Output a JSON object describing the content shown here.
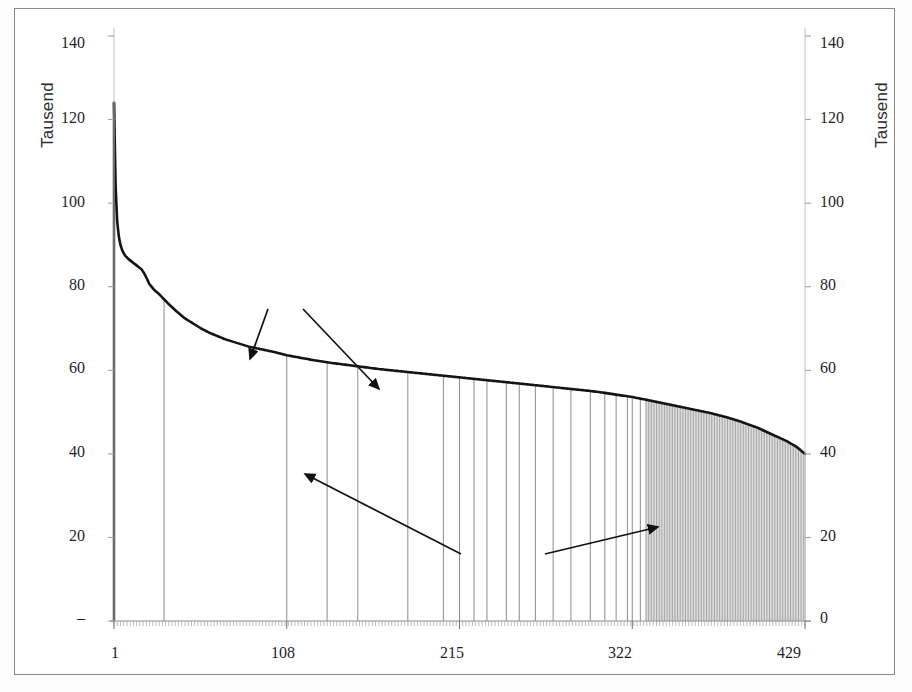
{
  "figure": {
    "background": "#ffffff",
    "frame_color": "#8a8a8a"
  },
  "chart_data": {
    "type": "bar",
    "title": "",
    "subtitle": "",
    "xlabel": "",
    "ylabel": "Tausend",
    "ylabel_right": "Tausend",
    "grid": false,
    "legend_position": "none",
    "xlim": [
      1,
      429
    ],
    "ylim": [
      0,
      140
    ],
    "yticks": [
      0,
      20,
      40,
      60,
      80,
      100,
      120,
      140
    ],
    "ytick_labels_left": [
      "–",
      "20",
      "40",
      "60",
      "80",
      "100",
      "120",
      "140"
    ],
    "ytick_labels_right": [
      "0",
      "20",
      "40",
      "60",
      "80",
      "100",
      "120",
      "140"
    ],
    "xticks": [
      1,
      108,
      215,
      322,
      429
    ],
    "xtick_labels": [
      "1",
      "108",
      "215",
      "322",
      "429"
    ],
    "series": [
      {
        "name": "Alle Kreise (sortiert, absteigend)",
        "kind": "bar-envelope",
        "x": [
          1,
          2,
          3,
          4,
          5,
          6,
          7,
          8,
          9,
          10,
          12,
          14,
          16,
          18,
          20,
          23,
          26,
          29,
          32,
          35,
          40,
          45,
          50,
          55,
          60,
          65,
          70,
          75,
          80,
          85,
          90,
          95,
          100,
          108,
          115,
          125,
          135,
          145,
          155,
          165,
          175,
          185,
          195,
          205,
          215,
          225,
          235,
          245,
          255,
          265,
          275,
          285,
          295,
          305,
          315,
          322,
          330,
          340,
          350,
          360,
          370,
          380,
          390,
          400,
          410,
          418,
          424,
          429
        ],
        "values": [
          124.0,
          104.0,
          95.5,
          92.0,
          90.0,
          88.8,
          88.0,
          87.4,
          87.0,
          86.6,
          86.0,
          85.4,
          84.8,
          84.2,
          83.0,
          80.6,
          79.2,
          78.2,
          77.0,
          75.8,
          74.0,
          72.4,
          71.2,
          70.0,
          69.0,
          68.2,
          67.4,
          66.8,
          66.2,
          65.6,
          65.2,
          64.8,
          64.4,
          63.6,
          63.1,
          62.4,
          61.8,
          61.3,
          60.8,
          60.3,
          59.9,
          59.5,
          59.1,
          58.7,
          58.3,
          57.9,
          57.5,
          57.1,
          56.7,
          56.3,
          55.9,
          55.5,
          55.1,
          54.6,
          54.0,
          53.6,
          53.0,
          52.2,
          51.4,
          50.6,
          49.8,
          48.8,
          47.6,
          46.2,
          44.4,
          43.0,
          41.6,
          40.0
        ]
      }
    ],
    "vertical_rules_x": [
      32,
      108,
      133,
      152,
      183,
      205,
      215,
      224,
      232,
      244,
      252,
      262,
      273,
      284,
      296,
      305,
      312,
      319,
      322,
      327,
      331,
      335,
      339,
      343,
      347,
      350,
      353,
      356,
      359,
      362,
      364,
      366,
      368,
      370,
      372,
      374,
      376,
      378,
      380,
      381,
      382,
      383,
      384,
      385,
      386,
      387,
      388,
      389,
      390,
      391,
      392,
      393,
      394,
      395,
      396,
      397,
      398,
      399,
      400,
      401,
      402,
      403,
      404,
      405,
      406,
      407,
      408,
      409,
      410,
      411,
      412,
      413,
      414,
      415,
      416,
      417,
      418,
      419,
      420,
      421,
      422,
      423,
      424,
      425,
      426,
      427,
      428,
      429
    ],
    "annotations": [
      {
        "id": "alte-laender",
        "text_line1": "Alte",
        "text_line2": "Länder",
        "label_x_px": 262,
        "label_y_px": 253,
        "arrows": [
          {
            "from": [
              253,
              300
            ],
            "to": [
              235,
              350
            ]
          },
          {
            "from": [
              288,
              300
            ],
            "to": [
              364,
              380
            ]
          }
        ]
      },
      {
        "id": "neue-laender",
        "text_line1": "Neue",
        "text_line2": "Länder",
        "label_x_px": 474,
        "label_y_px": 525,
        "arrows": [
          {
            "from": [
              446,
              545
            ],
            "to": [
              290,
              465
            ]
          },
          {
            "from": [
              530,
              545
            ],
            "to": [
              643,
              518
            ]
          }
        ]
      }
    ]
  }
}
